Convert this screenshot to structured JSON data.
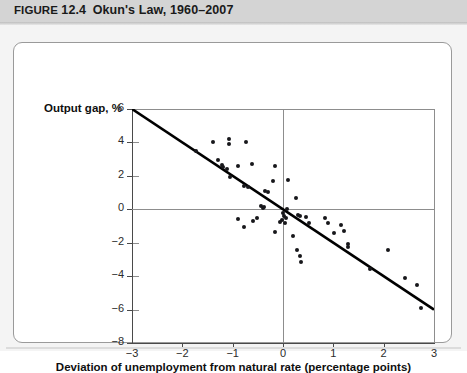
{
  "figure": {
    "label": "FIGURE",
    "number": "12.4",
    "caption": "Okun's Law, 1960–2007",
    "title_full": "FIGURE 12.4  Okun's Law, 1960–2007"
  },
  "colors": {
    "header_band": "#d4d4d4",
    "panel_bg": "#ffffff",
    "page_bg": "#f4f4f4",
    "axis": "#4a4a4a",
    "grid": "#8d8d8d",
    "dot": "#17171b",
    "trendline": "#000000"
  },
  "chart_data": {
    "type": "scatter",
    "title": "Okun's Law, 1960–2007",
    "xlabel": "Deviation of unemployment from natural rate (percentage points)",
    "ylabel": "Output gap, %",
    "xlim": [
      -3,
      3
    ],
    "ylim": [
      -8,
      6
    ],
    "xticks": [
      -3,
      -2,
      -1,
      0,
      1,
      2,
      3
    ],
    "xticklabels": [
      "−3",
      "−2",
      "−1",
      "0",
      "1",
      "2",
      "3"
    ],
    "yticks": [
      -8,
      -6,
      -4,
      -2,
      0,
      2,
      4,
      6
    ],
    "yticklabels": [
      "−8",
      "−6",
      "−4",
      "−2",
      "0",
      "2",
      "4",
      "6"
    ],
    "grid": true,
    "gridlines_h": [
      0
    ],
    "gridlines_v": [
      0
    ],
    "legend": null,
    "points": [
      [
        -1.72,
        3.48
      ],
      [
        -1.4,
        4.0
      ],
      [
        -1.08,
        4.22
      ],
      [
        -1.08,
        3.9
      ],
      [
        -0.74,
        4.0
      ],
      [
        -1.3,
        2.95
      ],
      [
        -1.22,
        2.62
      ],
      [
        -1.2,
        2.52
      ],
      [
        -1.12,
        2.44
      ],
      [
        -1.05,
        1.95
      ],
      [
        -0.9,
        2.6
      ],
      [
        -0.62,
        2.7
      ],
      [
        -0.78,
        1.38
      ],
      [
        -0.7,
        1.32
      ],
      [
        -0.16,
        2.6
      ],
      [
        -0.2,
        1.72
      ],
      [
        0.1,
        1.78
      ],
      [
        -0.35,
        1.12
      ],
      [
        -0.3,
        1.02
      ],
      [
        -0.44,
        0.22
      ],
      [
        -0.4,
        0.08
      ],
      [
        -0.38,
        0.12
      ],
      [
        0.26,
        0.68
      ],
      [
        0.08,
        0.0
      ],
      [
        0.0,
        -0.2
      ],
      [
        0.02,
        -0.4
      ],
      [
        0.05,
        -0.55
      ],
      [
        -0.02,
        -0.62
      ],
      [
        -0.05,
        -0.78
      ],
      [
        0.04,
        -0.82
      ],
      [
        0.3,
        -0.35
      ],
      [
        0.34,
        -0.4
      ],
      [
        0.46,
        -0.48
      ],
      [
        0.52,
        -0.82
      ],
      [
        -0.52,
        -0.52
      ],
      [
        -0.6,
        -0.7
      ],
      [
        -0.9,
        -0.6
      ],
      [
        -0.78,
        -1.08
      ],
      [
        -0.16,
        -1.35
      ],
      [
        0.2,
        -1.58
      ],
      [
        0.28,
        -2.45
      ],
      [
        0.34,
        -2.78
      ],
      [
        0.35,
        -3.15
      ],
      [
        0.84,
        -0.55
      ],
      [
        0.9,
        -0.8
      ],
      [
        1.02,
        -1.4
      ],
      [
        1.16,
        -0.92
      ],
      [
        1.22,
        -1.28
      ],
      [
        1.3,
        -2.1
      ],
      [
        1.3,
        -2.28
      ],
      [
        1.72,
        -3.55
      ],
      [
        2.08,
        -2.45
      ],
      [
        2.42,
        -4.1
      ],
      [
        2.66,
        -4.52
      ],
      [
        2.74,
        -5.92
      ]
    ],
    "trendline": {
      "x": [
        -3,
        3
      ],
      "y": [
        6,
        -6
      ],
      "slope": -2.0,
      "intercept": 0.0
    }
  }
}
